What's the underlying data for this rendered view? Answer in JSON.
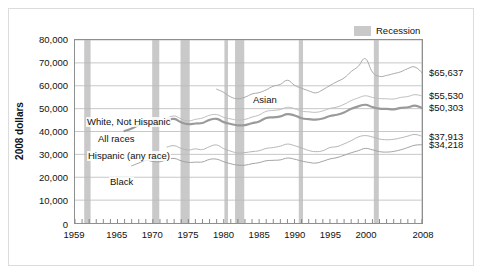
{
  "legend": {
    "label": "Recession",
    "swatch_color": "#c9c9c9"
  },
  "axes": {
    "ylabel": "2008 dollars",
    "yticks": [
      "80,000",
      "70,000",
      "60,000",
      "50,000",
      "40,000",
      "30,000",
      "20,000",
      "10,000",
      "0"
    ],
    "xticks": [
      "1959",
      "1965",
      "1970",
      "1975",
      "1980",
      "1985",
      "1990",
      "1995",
      "2000",
      "2008"
    ]
  },
  "series_labels": {
    "asian": "Asian",
    "white": "White, Not Hispanic",
    "all": "All races",
    "hispanic": "Hispanic (any race)",
    "black": "Black"
  },
  "end_values": {
    "asian": "$65,637",
    "white": "$55,530",
    "all": "$50,303",
    "hispanic": "$37,913",
    "black": "$34,218"
  },
  "chart_data": {
    "type": "line",
    "title": "",
    "xlabel": "",
    "ylabel": "2008 dollars",
    "xlim": [
      1959,
      2008
    ],
    "ylim": [
      0,
      80000
    ],
    "ytick_values": [
      0,
      10000,
      20000,
      30000,
      40000,
      50000,
      60000,
      70000,
      80000
    ],
    "xtick_values": [
      1959,
      1965,
      1970,
      1975,
      1980,
      1985,
      1990,
      1995,
      2000,
      2008
    ],
    "grid": "horizontal",
    "legend_position": "top-right",
    "x": [
      1959,
      1960,
      1961,
      1962,
      1963,
      1964,
      1965,
      1966,
      1967,
      1968,
      1969,
      1970,
      1971,
      1972,
      1973,
      1974,
      1975,
      1976,
      1977,
      1978,
      1979,
      1980,
      1981,
      1982,
      1983,
      1984,
      1985,
      1986,
      1987,
      1988,
      1989,
      1990,
      1991,
      1992,
      1993,
      1994,
      1995,
      1996,
      1997,
      1998,
      1999,
      2000,
      2001,
      2002,
      2003,
      2004,
      2005,
      2006,
      2007,
      2008
    ],
    "series": [
      {
        "name": "Asian",
        "color": "#a8a8a8",
        "width": 1.0,
        "label_value": "$65,637",
        "values": [
          null,
          null,
          null,
          null,
          null,
          null,
          null,
          null,
          null,
          null,
          null,
          null,
          null,
          null,
          null,
          null,
          null,
          null,
          null,
          null,
          58500,
          57100,
          55100,
          54300,
          55000,
          56400,
          57000,
          58200,
          59800,
          60600,
          62400,
          60200,
          58900,
          57800,
          56900,
          58300,
          60100,
          61800,
          63400,
          66200,
          68500,
          71800,
          66000,
          64100,
          64500,
          65300,
          66100,
          67500,
          68200,
          65637
        ]
      },
      {
        "name": "White, Not Hispanic",
        "color": "#bcbcbc",
        "width": 1.0,
        "label_value": "$55,530",
        "values": [
          null,
          null,
          null,
          null,
          null,
          null,
          null,
          null,
          null,
          null,
          null,
          null,
          null,
          45800,
          46800,
          45500,
          44600,
          45300,
          45900,
          47100,
          47400,
          46200,
          45500,
          45000,
          45300,
          46300,
          47200,
          48800,
          49200,
          49600,
          50600,
          50000,
          48900,
          48600,
          48400,
          49000,
          50100,
          50700,
          51900,
          53500,
          54700,
          55600,
          54900,
          54400,
          54300,
          54200,
          54900,
          55300,
          56100,
          55530
        ]
      },
      {
        "name": "All races",
        "color": "#9a9a9a",
        "width": 2.2,
        "label_value": "$50,303",
        "values": [
          null,
          null,
          null,
          null,
          null,
          null,
          null,
          40200,
          41300,
          42800,
          43800,
          43400,
          43300,
          44900,
          45500,
          44000,
          43200,
          43500,
          43700,
          45100,
          45500,
          44100,
          43300,
          42700,
          42800,
          43600,
          44400,
          45900,
          46200,
          46600,
          47600,
          47000,
          45800,
          45400,
          45200,
          45700,
          46800,
          47300,
          48300,
          49900,
          51000,
          51700,
          50700,
          50000,
          49900,
          49700,
          50300,
          50600,
          51300,
          50303
        ]
      },
      {
        "name": "Hispanic (any race)",
        "color": "#b4b4b4",
        "width": 1.0,
        "label_value": "$37,913",
        "values": [
          null,
          null,
          null,
          null,
          null,
          null,
          null,
          null,
          null,
          null,
          null,
          null,
          null,
          33200,
          33800,
          32600,
          31900,
          32400,
          32100,
          33400,
          34100,
          32500,
          31400,
          30600,
          30800,
          31200,
          31600,
          32600,
          33000,
          33600,
          34500,
          33800,
          32800,
          31700,
          31200,
          31600,
          33000,
          33400,
          34600,
          36000,
          37600,
          38200,
          37600,
          36700,
          36400,
          36600,
          37200,
          38000,
          38700,
          37913
        ]
      },
      {
        "name": "Black",
        "color": "#a0a0a0",
        "width": 1.0,
        "label_value": "$34,218",
        "values": [
          null,
          null,
          null,
          null,
          null,
          null,
          null,
          null,
          25000,
          26200,
          27400,
          26900,
          26800,
          27700,
          28200,
          27200,
          26500,
          26600,
          26700,
          27800,
          27900,
          26800,
          25900,
          25300,
          25300,
          25900,
          26400,
          27200,
          27400,
          27600,
          28400,
          27900,
          27100,
          26500,
          26200,
          27000,
          28000,
          28600,
          29600,
          30700,
          31600,
          32600,
          32000,
          31200,
          31000,
          31300,
          32000,
          33000,
          34000,
          34218
        ]
      }
    ],
    "recessions": [
      {
        "start": 1960.3,
        "end": 1961.2
      },
      {
        "start": 1969.9,
        "end": 1970.9
      },
      {
        "start": 1973.9,
        "end": 1975.2
      },
      {
        "start": 1980.1,
        "end": 1980.6
      },
      {
        "start": 1981.6,
        "end": 1982.9
      },
      {
        "start": 1990.6,
        "end": 1991.2
      },
      {
        "start": 2001.2,
        "end": 2001.9
      },
      {
        "start": 2007.9,
        "end": 2008.5
      }
    ],
    "recession_color": "#c9c9c9"
  }
}
